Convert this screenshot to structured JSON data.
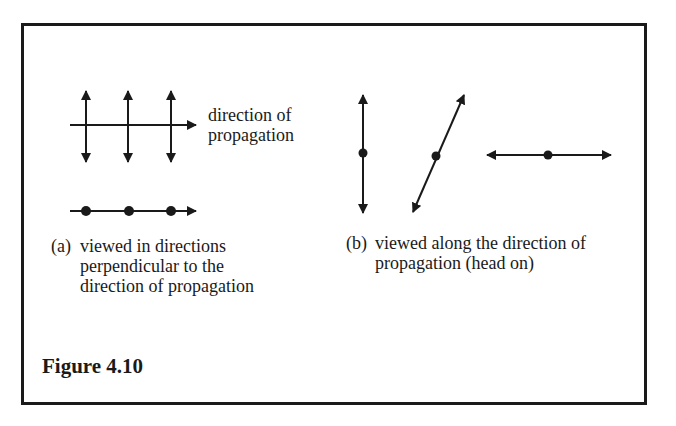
{
  "figure": {
    "title": "Figure 4.10",
    "border_color": "#1a1a1a",
    "ink_color": "#1a1a1a"
  },
  "panel_a": {
    "axis_label_line1": "direction of",
    "axis_label_line2": "propagation",
    "caption_prefix": "(a)",
    "caption_lines": [
      "viewed in directions",
      "perpendicular to the",
      "direction of propagation"
    ],
    "side_view": {
      "description": "three vertical double-headed oscillation arrows crossing a horizontal propagation arrow",
      "vertical_arrow_x": [
        86,
        128,
        171
      ],
      "vertical_arrow_y": [
        90,
        162
      ],
      "propagation_line": {
        "x1": 70,
        "x2": 196,
        "y": 125
      }
    },
    "top_view": {
      "description": "horizontal propagation arrow with three dots (oscillations seen edge-on)",
      "dot_x": [
        86,
        129,
        171
      ],
      "line": {
        "x1": 70,
        "x2": 196,
        "y": 211
      }
    }
  },
  "panel_b": {
    "caption_prefix": "(b)",
    "caption_lines": [
      "viewed along the direction of",
      "propagation (head on)"
    ],
    "views": [
      {
        "name": "vertical",
        "x1": 363,
        "y1": 95,
        "x2": 363,
        "y2": 213,
        "dot": [
          363,
          153
        ]
      },
      {
        "name": "diagonal",
        "x1": 413,
        "y1": 212,
        "x2": 464,
        "y2": 95,
        "dot": [
          436,
          156
        ]
      },
      {
        "name": "horizontal",
        "x1": 486,
        "y1": 155,
        "x2": 611,
        "y2": 155,
        "dot": [
          548,
          155
        ]
      }
    ]
  }
}
